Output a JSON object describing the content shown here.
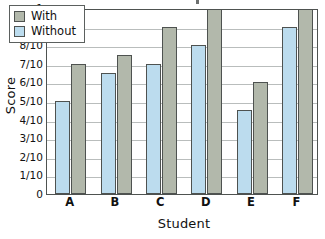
{
  "chart_data": {
    "type": "bar",
    "title": "",
    "xlabel": "Student",
    "ylabel": "Score",
    "categories": [
      "A",
      "B",
      "C",
      "D",
      "E",
      "F"
    ],
    "series": [
      {
        "name": "With",
        "color": "#b2b8ab",
        "values": [
          0.7,
          0.75,
          0.9,
          1.0,
          0.6,
          1.0
        ]
      },
      {
        "name": "Without",
        "color": "#bcdcee",
        "values": [
          0.5,
          0.65,
          0.7,
          0.8,
          0.45,
          0.9
        ]
      }
    ],
    "ylim": [
      0,
      1
    ],
    "ytick_values": [
      0,
      0.1,
      0.2,
      0.3,
      0.4,
      0.5,
      0.6,
      0.7,
      0.8,
      0.9,
      1.0
    ],
    "ytick_labels": [
      "0",
      "1/10",
      "2/10",
      "3/10",
      "4/10",
      "5/10",
      "6/10",
      "7/10",
      "8/10",
      "9/10",
      "1"
    ],
    "grid": true,
    "legend_position": "top-left",
    "legend_entries": [
      "With",
      "Without"
    ]
  },
  "axes": {
    "y_title": "Score",
    "x_title": "Student"
  },
  "legend": {
    "items": [
      {
        "label": "With"
      },
      {
        "label": "Without"
      }
    ]
  }
}
